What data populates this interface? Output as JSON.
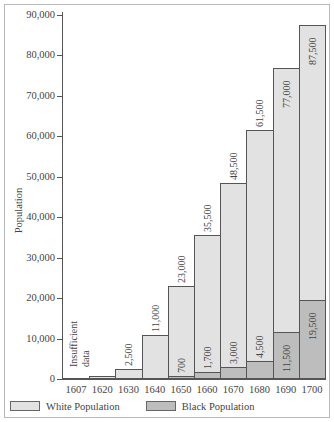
{
  "chart_data": {
    "type": "bar",
    "title": "",
    "xlabel": "",
    "ylabel": "Population",
    "ylim": [
      0,
      90000
    ],
    "yticks": [
      "0",
      "10,000",
      "20,000",
      "30,000",
      "40,000",
      "50,000",
      "60,000",
      "70,000",
      "80,000",
      "90,000"
    ],
    "grid": false,
    "legend_position": "bottom",
    "categories": [
      "1607",
      "1620",
      "1630",
      "1640",
      "1650",
      "1660",
      "1670",
      "1680",
      "1690",
      "1700"
    ],
    "series": [
      {
        "name": "White Population",
        "color": "#e2e2e2",
        "values": [
          null,
          null,
          2500,
          11000,
          23000,
          35500,
          48500,
          61500,
          77000,
          87500
        ],
        "labels": [
          "",
          "",
          "2,500",
          "11,000",
          "23,000",
          "35,500",
          "48,500",
          "61,500",
          "77,000",
          "87,500"
        ]
      },
      {
        "name": "Black Population",
        "color": "#bdbdbd",
        "values": [
          null,
          null,
          null,
          null,
          700,
          1700,
          3000,
          4500,
          11500,
          19500
        ],
        "labels": [
          "",
          "",
          "",
          "",
          "700",
          "1,700",
          "3,000",
          "4,500",
          "11,500",
          "19,500"
        ]
      }
    ],
    "annotations": [
      {
        "category": "1607-1620",
        "text": "Insufficient data"
      }
    ]
  },
  "labels": {
    "insufficient_line1": "Insufficient",
    "insufficient_line2": "data"
  },
  "legend": {
    "white": "White Population",
    "black": "Black Population"
  }
}
